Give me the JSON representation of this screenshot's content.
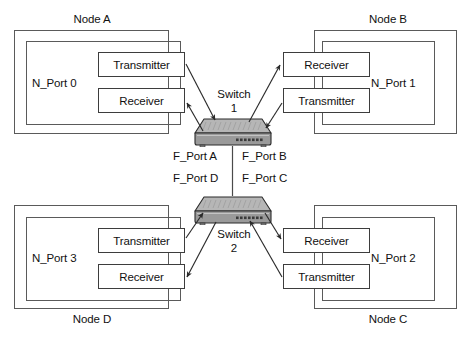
{
  "diagram": {
    "colors": {
      "frame_stroke": "#5a5a5a",
      "box_stroke": "#3d3d3d",
      "text": "#111111",
      "switch_top": "#b9b9b9",
      "switch_front": "#8f8f8f",
      "switch_outline": "#2b2b2b",
      "arrow": "#2b2b2b",
      "background": "#ffffff"
    },
    "nodes": [
      {
        "id": "node-a",
        "node_label": "Node A",
        "port_label": "N_Port 0",
        "transceivers": [
          {
            "id": "transmitter",
            "label": "Transmitter"
          },
          {
            "id": "receiver",
            "label": "Receiver"
          }
        ]
      },
      {
        "id": "node-b",
        "node_label": "Node B",
        "port_label": "N_Port 1",
        "transceivers": [
          {
            "id": "receiver",
            "label": "Receiver"
          },
          {
            "id": "transmitter",
            "label": "Transmitter"
          }
        ]
      },
      {
        "id": "node-d",
        "node_label": "Node D",
        "port_label": "N_Port 3",
        "transceivers": [
          {
            "id": "transmitter",
            "label": "Transmitter"
          },
          {
            "id": "receiver",
            "label": "Receiver"
          }
        ]
      },
      {
        "id": "node-c",
        "node_label": "Node C",
        "port_label": "N_Port 2",
        "transceivers": [
          {
            "id": "receiver",
            "label": "Receiver"
          },
          {
            "id": "transmitter",
            "label": "Transmitter"
          }
        ]
      }
    ],
    "switches": [
      {
        "id": "switch-1",
        "name": "Switch",
        "number": "1"
      },
      {
        "id": "switch-2",
        "name": "Switch",
        "number": "2"
      }
    ],
    "fabric_ports": [
      {
        "id": "f-port-a",
        "label": "F_Port A"
      },
      {
        "id": "f-port-b",
        "label": "F_Port B"
      },
      {
        "id": "f-port-d",
        "label": "F_Port D"
      },
      {
        "id": "f-port-c",
        "label": "F_Port C"
      }
    ]
  }
}
